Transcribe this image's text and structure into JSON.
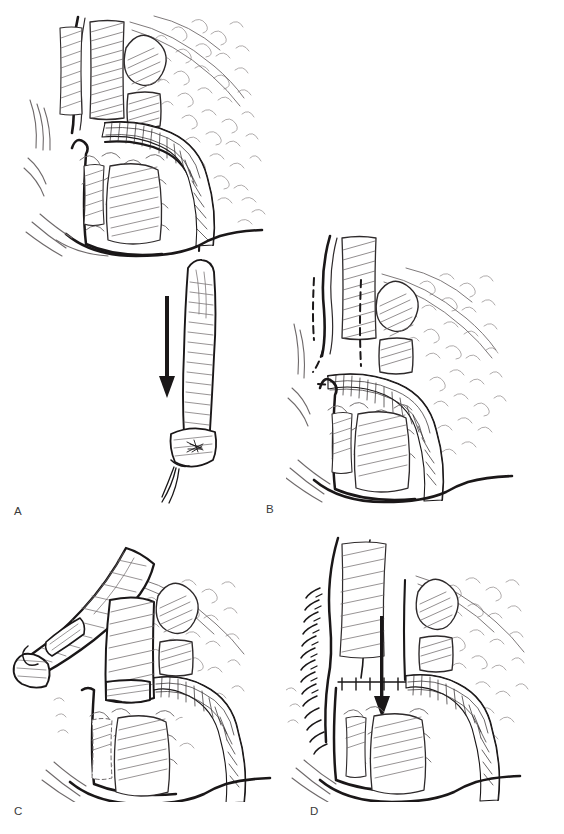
{
  "figure": {
    "kind": "surgical-technique-line-art",
    "page_size": {
      "width": 564,
      "height": 834
    },
    "background_color": "#ffffff",
    "ink_color": "#1a1718",
    "secondary_ink_color": "#6f6a6b",
    "style": "black-and-white pen-and-ink medical illustration, hatched and stippled",
    "caption_partial": "",
    "panel_count": 4
  },
  "panels": [
    {
      "label": "A",
      "label_x": 14,
      "label_y": 512,
      "frame": {
        "x": 6,
        "y": 8,
        "width": 270,
        "height": 248
      },
      "description": "Sagittal view of pelvic / perineal anatomy with hatched muscle layers, lobular fatty tissue and a curved cross-hatched tubular structure crossing the field",
      "features": [
        "hatched muscle bundles",
        "lobular fat stipple",
        "curved cross-hatched tubular conduit",
        "heavy outline contour",
        "stacked hatched segments"
      ],
      "inset": {
        "description": "Harvested tubular graft shown separately, ligated at its distal end with suture tails, and a solid arrow indicating direction of transfer",
        "frame": {
          "x": 140,
          "y": 258,
          "width": 120,
          "height": 250
        },
        "arrow": {
          "x": 158,
          "y_top": 297,
          "y_bottom": 390,
          "direction": "down"
        },
        "graft": {
          "x": 178,
          "y": 262,
          "width": 42,
          "height": 200,
          "end": "ligated-with-suture-tails"
        }
      }
    },
    {
      "label": "B",
      "label_x": 266,
      "label_y": 510,
      "frame": {
        "x": 286,
        "y": 232,
        "width": 272,
        "height": 272
      },
      "description": "Same anatomy with the tubular conduit in place; dashed lines mark the planned incision / flap outline",
      "features": [
        "two vertical dashed incision lines",
        "angled dashed line at left margin",
        "short horizontal dashed line at flap base",
        "cross-hatched tubular conduit",
        "hatched muscle and lobular fat"
      ],
      "dashed_lines": 4
    },
    {
      "label": "C",
      "label_x": 14,
      "label_y": 812,
      "frame": {
        "x": 6,
        "y": 530,
        "width": 272,
        "height": 272
      },
      "description": "The flap has been raised and reflected to the left, exposing the underlying bed and the tubular conduit",
      "features": [
        "reflected hatched flap with cut edge",
        "exposed rectangular defect in tissue bed",
        "cross-hatched tubular conduit",
        "lobular fat stipple",
        "heavy contour outline"
      ]
    },
    {
      "label": "D",
      "label_x": 310,
      "label_y": 812,
      "frame": {
        "x": 286,
        "y": 530,
        "width": 272,
        "height": 272
      },
      "description": "Completed repair: flap advanced and closed with a line of interrupted sutures; arrow shows direction of advancement",
      "features": [
        "interrupted suture line along left closure edge",
        "solid advancement arrow pointing down",
        "parallel advanced flap edges",
        "cross-hatched tubular conduit",
        "hatched muscle and lobular fat"
      ],
      "arrow": {
        "x": 383,
        "y_top": 617,
        "y_bottom": 707,
        "direction": "down"
      },
      "suture_stitch_count": 14
    }
  ]
}
